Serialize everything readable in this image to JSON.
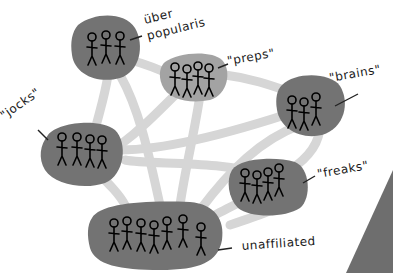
{
  "diagram": {
    "type": "social-network-groups",
    "colors": {
      "background": "#ffffff",
      "blob_dark": "#737373",
      "blob_light": "#a3a3a3",
      "connection": "#d6d6d6",
      "figure_stroke": "#000000",
      "corner_shape": "#6e6e6e"
    },
    "groups": [
      {
        "id": "uber",
        "label_line1": "über",
        "label_line2": "popularis",
        "figures": 3
      },
      {
        "id": "preps",
        "label": "\"preps\"",
        "figures": 4
      },
      {
        "id": "brains",
        "label": "\"brains\"",
        "figures": 3
      },
      {
        "id": "jocks",
        "label": "\"jocks\"",
        "figures": 4
      },
      {
        "id": "freaks",
        "label": "\"freaks\"",
        "figures": 4
      },
      {
        "id": "unaffiliated",
        "label": "unaffiliated",
        "figures": 7
      }
    ]
  }
}
